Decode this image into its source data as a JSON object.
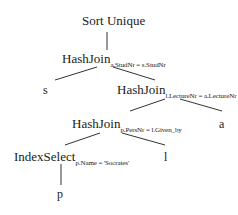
{
  "diagram": {
    "type": "query-execution-plan-tree",
    "nodes": {
      "root": {
        "label": "Sort Unique"
      },
      "join1": {
        "label": "HashJoin",
        "condition": "a.StudNr = s.StudNr"
      },
      "leaf_s": {
        "label": "s"
      },
      "join2": {
        "label": "HashJoin",
        "condition": "l.LectureNr = a.LectureNr"
      },
      "join3": {
        "label": "HashJoin",
        "condition": "p.PersNr = l.Given_by"
      },
      "leaf_a": {
        "label": "a"
      },
      "select": {
        "label": "IndexSelect",
        "condition": "p.Name = 'Socrates'"
      },
      "leaf_l": {
        "label": "l"
      },
      "leaf_p": {
        "label": "p"
      }
    },
    "edges": [
      [
        "root",
        "join1"
      ],
      [
        "join1",
        "leaf_s"
      ],
      [
        "join1",
        "join2"
      ],
      [
        "join2",
        "join3"
      ],
      [
        "join2",
        "leaf_a"
      ],
      [
        "join3",
        "select"
      ],
      [
        "join3",
        "leaf_l"
      ],
      [
        "select",
        "leaf_p"
      ]
    ],
    "colors": {
      "line": "#333333",
      "text": "#1a1a1a",
      "background": "#ffffff"
    }
  }
}
